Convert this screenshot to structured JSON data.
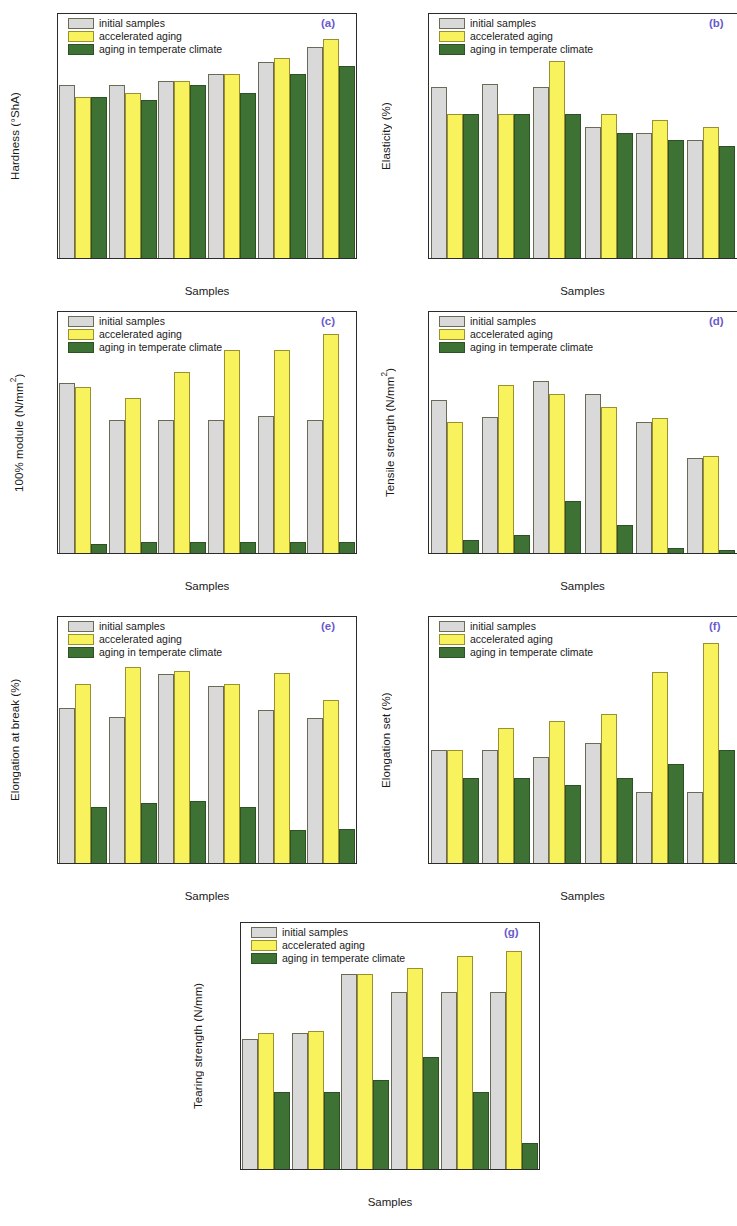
{
  "figure": {
    "series_names": [
      "initial samples",
      "accelerated aging",
      "aging in temperate climate"
    ],
    "series_colors": [
      "#d9d9d9",
      "#f8f35c",
      "#3e7234"
    ],
    "categories": [
      "NR",
      "NR-10",
      "NR-20",
      "NR-30",
      "NR-40",
      "NR-50"
    ],
    "xlabel": "Samples",
    "tag_color": "#6a5acd"
  },
  "chart_data": [
    {
      "type": "bar",
      "tag": "(a)",
      "title": "",
      "ylabel": "Hardness (°ShA)",
      "xlabel": "Samples",
      "categories": [
        "NR",
        "NR-10",
        "NR-20",
        "NR-30",
        "NR-40",
        "NR-50"
      ],
      "yticks": [
        0,
        10,
        20,
        30,
        40,
        50,
        60
      ],
      "ytick_labels": [
        "0",
        "10",
        "20",
        "30",
        "40",
        "50",
        "60"
      ],
      "ylim": [
        0,
        64
      ],
      "grid": false,
      "legend_position": "top-left",
      "series": [
        {
          "name": "initial samples",
          "values": [
            45,
            45,
            46,
            48,
            51,
            55
          ]
        },
        {
          "name": "accelerated aging",
          "values": [
            42,
            43,
            46,
            48,
            52,
            57
          ]
        },
        {
          "name": "aging in temperate climate",
          "values": [
            42,
            41,
            45,
            43,
            48,
            50
          ]
        }
      ]
    },
    {
      "type": "bar",
      "tag": "(b)",
      "title": "",
      "ylabel": "Elasticity (%)",
      "xlabel": "Samples",
      "categories": [
        "NR",
        "NR-10",
        "NR-20",
        "NR-30",
        "NR-40",
        "NR-50"
      ],
      "yticks": [
        0,
        10,
        20,
        30,
        40,
        50,
        60,
        70
      ],
      "ytick_labels": [
        "0",
        "10",
        "20",
        "30",
        "40",
        "50",
        "60",
        "70"
      ],
      "ylim": [
        0,
        75
      ],
      "grid": false,
      "legend_position": "top-left",
      "series": [
        {
          "name": "initial samples",
          "values": [
            52,
            53,
            52,
            40,
            38,
            36
          ]
        },
        {
          "name": "accelerated aging",
          "values": [
            44,
            44,
            60,
            44,
            42,
            40
          ]
        },
        {
          "name": "aging in temperate climate",
          "values": [
            44,
            44,
            44,
            38,
            36,
            34
          ]
        }
      ]
    },
    {
      "type": "bar",
      "tag": "(c)",
      "title": "",
      "ylabel": "100% module (N/mm²)",
      "xlabel": "Samples",
      "categories": [
        "NR",
        "NR-10",
        "NR-20",
        "NR-30",
        "NR-40",
        "NR-50"
      ],
      "yticks": [
        0.0,
        0.2,
        0.4,
        0.6,
        0.8,
        1.0
      ],
      "ytick_labels": [
        "0.0",
        "0.2",
        "0.4",
        "0.6",
        "0.8",
        "1.0"
      ],
      "ylim": [
        0,
        1.1
      ],
      "grid": false,
      "legend_position": "top-left",
      "series": [
        {
          "name": "initial samples",
          "values": [
            0.77,
            0.6,
            0.6,
            0.6,
            0.62,
            0.6
          ]
        },
        {
          "name": "accelerated aging",
          "values": [
            0.75,
            0.7,
            0.82,
            0.92,
            0.92,
            0.99
          ]
        },
        {
          "name": "aging in temperate climate",
          "values": [
            0.04,
            0.05,
            0.05,
            0.05,
            0.05,
            0.05
          ]
        }
      ]
    },
    {
      "type": "bar",
      "tag": "(d)",
      "title": "",
      "ylabel": "Tensile strength (N/mm²)",
      "xlabel": "Samples",
      "categories": [
        "NR",
        "NR-10",
        "NR-20",
        "NR-30",
        "NR-40",
        "NR-50"
      ],
      "yticks": [
        0,
        2,
        4,
        6,
        8,
        10,
        12
      ],
      "ytick_labels": [
        "0",
        "2",
        "4",
        "6",
        "8",
        "10",
        "12"
      ],
      "ylim": [
        0,
        13
      ],
      "grid": false,
      "legend_position": "top-left",
      "series": [
        {
          "name": "initial samples",
          "values": [
            8.2,
            7.3,
            9.2,
            8.5,
            7.0,
            5.1
          ]
        },
        {
          "name": "accelerated aging",
          "values": [
            7.0,
            9.0,
            8.5,
            7.8,
            7.2,
            5.2
          ]
        },
        {
          "name": "aging in temperate climate",
          "values": [
            0.7,
            0.95,
            2.8,
            1.5,
            0.25,
            0.15
          ]
        }
      ]
    },
    {
      "type": "bar",
      "tag": "(e)",
      "title": "",
      "ylabel": "Elongation at break (%)",
      "xlabel": "Samples",
      "categories": [
        "NR",
        "NR-10",
        "NR-20",
        "NR-30",
        "NR-40",
        "NR-50"
      ],
      "yticks": [
        0,
        100,
        200,
        300,
        400,
        500,
        600,
        700,
        800
      ],
      "ytick_labels": [
        "0",
        "100",
        "200",
        "300",
        "400",
        "500",
        "600",
        "700",
        "800"
      ],
      "ylim": [
        0,
        800
      ],
      "grid": false,
      "legend_position": "top-left",
      "series": [
        {
          "name": "initial samples",
          "values": [
            500,
            472,
            611,
            571,
            493,
            468
          ]
        },
        {
          "name": "accelerated aging",
          "values": [
            578,
            632,
            619,
            578,
            612,
            527
          ]
        },
        {
          "name": "aging in temperate climate",
          "values": [
            180,
            193,
            199,
            180,
            106,
            111
          ]
        }
      ]
    },
    {
      "type": "bar",
      "tag": "(f)",
      "title": "",
      "ylabel": "Elongation set (%)",
      "xlabel": "Samples",
      "categories": [
        "NR",
        "NR-10",
        "NR-20",
        "NR-30",
        "NR-40",
        "NR-50"
      ],
      "yticks": [
        0,
        5,
        10,
        15,
        20,
        25,
        30,
        35
      ],
      "ytick_labels": [
        "0",
        "5",
        "10",
        "15",
        "20",
        "25",
        "30",
        "35"
      ],
      "ylim": [
        0,
        35
      ],
      "grid": false,
      "legend_position": "top-left",
      "series": [
        {
          "name": "initial samples",
          "values": [
            16,
            16,
            15,
            17,
            10,
            10
          ]
        },
        {
          "name": "accelerated aging",
          "values": [
            16,
            19,
            20,
            21,
            27,
            31
          ]
        },
        {
          "name": "aging in temperate climate",
          "values": [
            12,
            12,
            11,
            12,
            14,
            16
          ]
        }
      ]
    },
    {
      "type": "bar",
      "tag": "(g)",
      "title": "",
      "ylabel": "Tearing strength (N/mm)",
      "xlabel": "Samples",
      "categories": [
        "NR",
        "NR-10",
        "NR-20",
        "NR-30",
        "NR-40",
        "NR-50"
      ],
      "yticks": [
        0,
        5,
        10,
        15,
        20
      ],
      "ytick_labels": [
        "0",
        "5",
        "10",
        "15",
        "20"
      ],
      "ylim": [
        0,
        21
      ],
      "grid": false,
      "legend_position": "top-left",
      "series": [
        {
          "name": "initial samples",
          "values": [
            11.0,
            11.5,
            16.5,
            15.0,
            15.0,
            15.0
          ]
        },
        {
          "name": "accelerated aging",
          "values": [
            11.5,
            11.7,
            16.5,
            17.0,
            18.0,
            18.5
          ]
        },
        {
          "name": "aging in temperate climate",
          "values": [
            6.5,
            6.5,
            7.5,
            9.5,
            6.5,
            2.2
          ]
        }
      ]
    }
  ]
}
